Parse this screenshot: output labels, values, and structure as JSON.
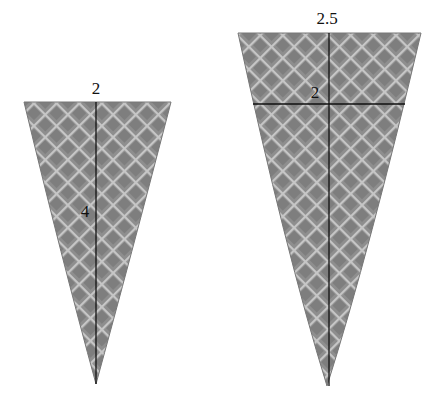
{
  "diagram": {
    "type": "two waffle cones with dimension lines",
    "cones": [
      {
        "id": "small-cone",
        "top_label": "2",
        "height_label": "4"
      },
      {
        "id": "large-cone",
        "top_label": "2.5",
        "inner_width_label": "2"
      }
    ],
    "colors": {
      "cone_fill": "#8c8c8c",
      "waffle_lines": "#c4c4c4",
      "dimension_lines": "#111111",
      "background": "#ffffff"
    }
  }
}
